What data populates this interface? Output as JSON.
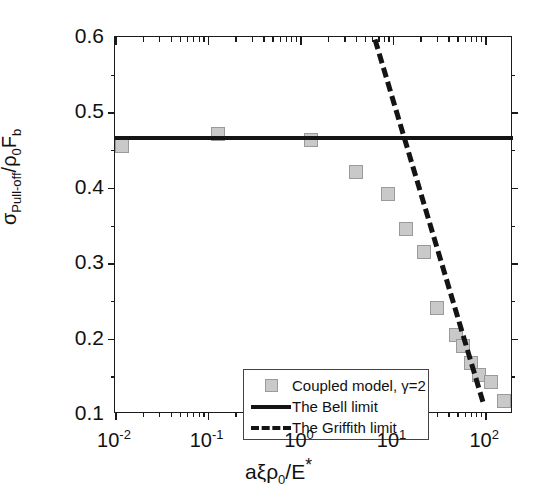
{
  "chart_data": {
    "type": "scatter",
    "title": "",
    "xlabel": "aξρ₀/E*",
    "ylabel": "σ_Pull-off/ρ₀F_b",
    "xscale": "log",
    "yscale": "linear",
    "xlim": [
      0.01,
      200
    ],
    "ylim": [
      0.1,
      0.6
    ],
    "grid": false,
    "legend_position": "bottom-left",
    "x_ticklabels": [
      "10-2",
      "10-1",
      "100",
      "101",
      "102"
    ],
    "x_tick_values": [
      0.01,
      0.1,
      1,
      10,
      100
    ],
    "y_ticklabels": [
      "0.1",
      "0.2",
      "0.3",
      "0.4",
      "0.5",
      "0.6"
    ],
    "y_tick_values": [
      0.1,
      0.2,
      0.3,
      0.4,
      0.5,
      0.6
    ],
    "series": [
      {
        "name": "Coupled model, γ=2",
        "type": "scatter",
        "marker": "square",
        "color": "#c9c9c9",
        "edge_color": "#9a9a9a",
        "x": [
          0.012,
          0.13,
          1.3,
          4.0,
          9.0,
          14.0,
          22.0,
          30.0,
          48.0,
          58.0,
          70.0,
          85.0,
          115.0,
          160.0
        ],
        "y": [
          0.455,
          0.472,
          0.463,
          0.421,
          0.392,
          0.345,
          0.315,
          0.24,
          0.205,
          0.19,
          0.168,
          0.152,
          0.142,
          0.117
        ]
      },
      {
        "name": "The Bell limit",
        "type": "line",
        "style": "solid",
        "color": "#141414",
        "x": [
          0.01,
          200
        ],
        "y": [
          0.466,
          0.466
        ]
      },
      {
        "name": "The Griffith limit",
        "type": "line",
        "style": "dashed",
        "color": "#141414",
        "x": [
          6.5,
          95.0
        ],
        "y": [
          0.6,
          0.12
        ]
      }
    ]
  },
  "axes": {
    "x_title": {
      "a": "a",
      "xi": "ξ",
      "rho": "ρ",
      "rho_sub": "0",
      "slash": "/E",
      "star": "*"
    },
    "y_title": {
      "sigma": "σ",
      "sigma_sub": "Pull-off",
      "slash": "/",
      "rho": "ρ",
      "rho_sub": "0",
      "F": "F",
      "F_sub": "b"
    },
    "x_labels": [
      {
        "base": "10",
        "exp": "-2"
      },
      {
        "base": "10",
        "exp": "-1"
      },
      {
        "base": "10",
        "exp": "0"
      },
      {
        "base": "10",
        "exp": "1"
      },
      {
        "base": "10",
        "exp": "2"
      }
    ],
    "y_labels": [
      "0.6",
      "0.5",
      "0.4",
      "0.3",
      "0.2",
      "0.1"
    ]
  },
  "legend": {
    "items": [
      {
        "label": "Coupled model, γ=2",
        "key": "square-swatch"
      },
      {
        "label": "The Bell limit",
        "key": "solid-line-swatch"
      },
      {
        "label": "The Griffith limit",
        "key": "dashed-line-swatch"
      }
    ]
  }
}
